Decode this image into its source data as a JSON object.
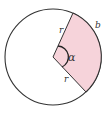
{
  "diagram": {
    "type": "circle-sector",
    "labels": {
      "radius_top": "r",
      "radius_bottom": "r",
      "angle": "α",
      "arc": "b"
    },
    "colors": {
      "sector_fill": "#f6d3da",
      "stroke": "#333333",
      "background": "#ffffff"
    }
  }
}
